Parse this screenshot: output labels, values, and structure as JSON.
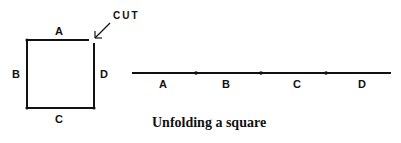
{
  "diagram": {
    "square": {
      "labels": {
        "top": "A",
        "left": "B",
        "bottom": "C",
        "right": "D"
      },
      "cut_label": "CUT"
    },
    "line": {
      "segments": [
        "A",
        "B",
        "C",
        "D"
      ]
    },
    "caption": "Unfolding a square"
  }
}
